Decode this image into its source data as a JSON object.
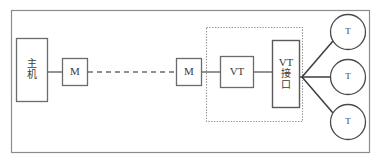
{
  "diagram": {
    "colors": {
      "stroke": "#555555",
      "stroke_dark": "#3c3c3c",
      "dotted": "#909090",
      "frame": "#888888",
      "background": "#ffffff",
      "text": "#3a3a3a"
    },
    "outer_frame": {
      "x": 11,
      "y": 10,
      "width": 359,
      "height": 143
    },
    "dotted_group": {
      "x": 206,
      "y": 27,
      "width": 97,
      "height": 95
    },
    "nodes": [
      {
        "id": "host",
        "shape": "rect",
        "lines": [
          "主",
          "机"
        ],
        "label_style": "cn",
        "x": 16,
        "y": 38,
        "width": 32,
        "height": 64
      },
      {
        "id": "modem-local",
        "shape": "rect",
        "lines": [
          "M"
        ],
        "label_style": "lat",
        "x": 62,
        "y": 58,
        "width": 26,
        "height": 28
      },
      {
        "id": "modem-remote",
        "shape": "rect",
        "lines": [
          "M"
        ],
        "label_style": "lat",
        "x": 176,
        "y": 58,
        "width": 26,
        "height": 28
      },
      {
        "id": "vt",
        "shape": "rect",
        "lines": [
          "VT"
        ],
        "label_style": "lat",
        "x": 220,
        "y": 56,
        "width": 34,
        "height": 32
      },
      {
        "id": "vt-interface",
        "shape": "rect",
        "lines": [
          "VT",
          "接",
          "口"
        ],
        "label_style": "cn",
        "x": 272,
        "y": 40,
        "width": 28,
        "height": 68
      },
      {
        "id": "terminal-top",
        "shape": "circle",
        "lines": [
          "T"
        ],
        "label_style": "t",
        "cx": 348,
        "cy": 32,
        "r": 18
      },
      {
        "id": "terminal-middle",
        "shape": "circle",
        "lines": [
          "T"
        ],
        "label_style": "t",
        "cx": 348,
        "cy": 77,
        "r": 18
      },
      {
        "id": "terminal-bottom",
        "shape": "circle",
        "lines": [
          "T"
        ],
        "label_style": "t",
        "cx": 348,
        "cy": 122,
        "r": 18
      }
    ],
    "connections": [
      {
        "id": "host-to-modem-local",
        "style": "solid",
        "x1": 48,
        "y1": 72,
        "x2": 62,
        "y2": 72
      },
      {
        "id": "modem-local-to-modem-remote",
        "style": "dashed",
        "x1": 88,
        "y1": 72,
        "x2": 176,
        "y2": 72
      },
      {
        "id": "modem-remote-to-vt",
        "style": "solid",
        "x1": 202,
        "y1": 72,
        "x2": 220,
        "y2": 72
      },
      {
        "id": "vt-to-vt-interface",
        "style": "solid",
        "x1": 254,
        "y1": 72,
        "x2": 272,
        "y2": 72
      },
      {
        "id": "vt-interface-to-junction",
        "style": "solid",
        "x1": 300,
        "y1": 77,
        "x2": 303,
        "y2": 77
      },
      {
        "id": "junction-to-terminal-top",
        "style": "solid",
        "x1": 303,
        "y1": 77,
        "x2": 332,
        "y2": 40
      },
      {
        "id": "junction-to-terminal-middle",
        "style": "solid",
        "x1": 303,
        "y1": 77,
        "x2": 330,
        "y2": 77
      },
      {
        "id": "junction-to-terminal-bottom",
        "style": "solid",
        "x1": 303,
        "y1": 77,
        "x2": 332,
        "y2": 114
      }
    ]
  }
}
